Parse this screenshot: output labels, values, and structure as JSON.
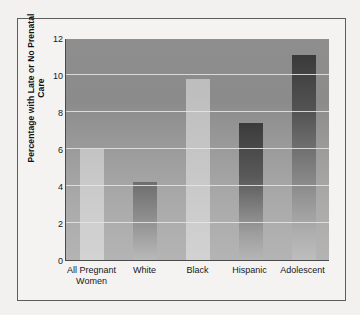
{
  "chart_data": {
    "type": "bar",
    "title": "",
    "xlabel": "",
    "ylabel": "Percentage with Late or No Prenatal Care",
    "categories": [
      "All Pregnant Women",
      "White",
      "Black",
      "Hispanic",
      "Adolescent"
    ],
    "category_lines": [
      [
        "All Pregnant",
        "Women"
      ],
      [
        "White"
      ],
      [
        "Black"
      ],
      [
        "Hispanic"
      ],
      [
        "Adolescent"
      ]
    ],
    "values": [
      6.0,
      4.2,
      9.8,
      7.4,
      11.1
    ],
    "ylim": [
      0,
      12
    ],
    "yticks": [
      0,
      2,
      4,
      6,
      8,
      10,
      12
    ],
    "ytick_labels": [
      "0",
      "2",
      "4",
      "6",
      "8",
      "10",
      "12"
    ],
    "grid": true,
    "grid_axis": "y",
    "legend": false,
    "legend_position": "none",
    "colors": {
      "plot_background": "#9a9a9a",
      "gridline": "#e6e6e6",
      "axis": "#4a4a4a",
      "figure_background": "#f4f3f1",
      "text": "#17171a",
      "bar_all_pregnant_women": "#cbcbcb",
      "bar_white": "#8d8d8d",
      "bar_black": "#c6c6c6",
      "bar_hispanic": "#5a5a5a",
      "bar_adolescent": "#545454"
    }
  }
}
